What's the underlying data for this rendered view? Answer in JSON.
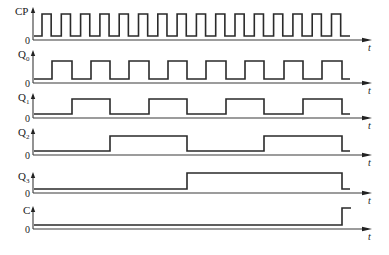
{
  "diagram": {
    "type": "timing",
    "time_axis_label": "t",
    "zero_label": "0",
    "x_axis": {
      "origin_x": 33,
      "end_x": 372
    },
    "clock": {
      "first_rise": 42,
      "half_period": 9.65,
      "pulses": 16,
      "signal_end_x": 350
    },
    "signals": [
      {
        "name": "CP",
        "main": "CP",
        "sub": "",
        "arrow_top": 7,
        "high_y": 14,
        "low_y": 36,
        "zero_y": 40,
        "type": "clock"
      },
      {
        "name": "Q0",
        "main": "Q",
        "sub": "0",
        "arrow_top": 50,
        "high_y": 61,
        "low_y": 79,
        "zero_y": 83,
        "edges": [
          52,
          72,
          91,
          110,
          129,
          149,
          168,
          187,
          206,
          226,
          245,
          264,
          284,
          303,
          322,
          342
        ],
        "start_level": 0,
        "signal_end_x": 350
      },
      {
        "name": "Q1",
        "main": "Q",
        "sub": "1",
        "arrow_top": 93,
        "high_y": 99,
        "low_y": 114,
        "zero_y": 118,
        "edges": [
          72,
          110,
          149,
          187,
          226,
          264,
          303,
          342
        ],
        "start_level": 0,
        "signal_end_x": 350
      },
      {
        "name": "Q2",
        "main": "Q",
        "sub": "2",
        "arrow_top": 128,
        "high_y": 136,
        "low_y": 151,
        "zero_y": 155,
        "edges": [
          110,
          187,
          264,
          342
        ],
        "start_level": 0,
        "signal_end_x": 350
      },
      {
        "name": "Q3",
        "main": "Q",
        "sub": "3",
        "arrow_top": 172,
        "high_y": 173,
        "low_y": 189,
        "zero_y": 193,
        "edges": [
          187,
          342
        ],
        "start_level": 0,
        "signal_end_x": 350
      },
      {
        "name": "C",
        "main": "C",
        "sub": "",
        "arrow_top": 206,
        "high_y": 208,
        "low_y": 225,
        "zero_y": 229,
        "edges": [
          342
        ],
        "start_level": 0,
        "signal_end_x": 351
      }
    ]
  }
}
